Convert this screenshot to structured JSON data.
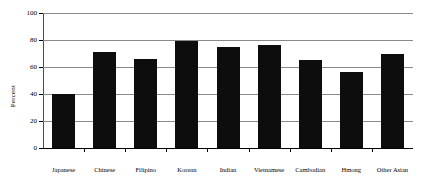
{
  "chart_data": {
    "type": "bar",
    "title": "",
    "xlabel": "",
    "ylabel": "Percent",
    "ylim": [
      0,
      100
    ],
    "yticks": [
      0,
      20,
      40,
      60,
      80,
      100
    ],
    "grid": true,
    "legend": "none",
    "bar_color": "#0d0d0d",
    "categories": [
      "Japanese",
      "Chinese",
      "Filipino",
      "Korean",
      "Indian",
      "Vietnamese",
      "Cambodian",
      "Hmong",
      "Other Asian"
    ],
    "values": [
      40,
      71,
      66,
      79,
      75,
      76,
      65,
      56,
      70
    ]
  }
}
